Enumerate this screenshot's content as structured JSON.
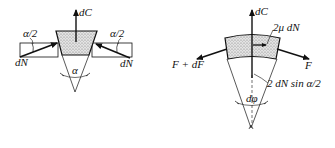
{
  "figure": {
    "left_panel": {
      "name": "v-belt-cross-section",
      "labels": {
        "dC": "dC",
        "alpha_half_left": "α/2",
        "alpha_half_right": "α/2",
        "dN_left": "dN",
        "dN_right": "dN",
        "alpha": "α"
      }
    },
    "right_panel": {
      "name": "belt-element-free-body",
      "labels": {
        "dC": "dC",
        "friction": "2μ dN",
        "tension_left": "F + dF",
        "tension_right": "F",
        "normal_resultant": "2 dN sin α/2",
        "dphi": "dφ"
      }
    },
    "colors": {
      "stroke": "#111111",
      "fill_stipple": "#cfcfcf",
      "background": "#ffffff"
    }
  }
}
